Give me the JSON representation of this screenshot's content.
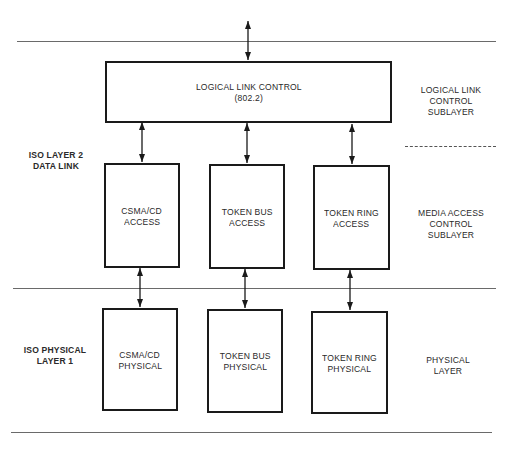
{
  "diagram": {
    "top_connector": {
      "label": ""
    },
    "llc": {
      "box_line1": "LOGICAL LINK CONTROL",
      "box_line2": "(802.2)",
      "side_line1": "LOGICAL LINK",
      "side_line2": "CONTROL SUBLAYER"
    },
    "layer2": {
      "label_line1": "ISO LAYER 2",
      "label_line2": "DATA LINK"
    },
    "mac": {
      "side_line1": "MEDIA ACCESS",
      "side_line2": "CONTROL SUBLAYER",
      "boxes": [
        {
          "line1": "CSMA/CD",
          "line2": "ACCESS"
        },
        {
          "line1": "TOKEN BUS",
          "line2": "ACCESS"
        },
        {
          "line1": "TOKEN RING",
          "line2": "ACCESS"
        }
      ]
    },
    "layer1": {
      "label_line1": "ISO PHYSICAL",
      "label_line2": "LAYER 1",
      "side_line1": "PHYSICAL",
      "side_line2": "LAYER",
      "boxes": [
        {
          "line1": "CSMA/CD",
          "line2": "PHYSICAL"
        },
        {
          "line1": "TOKEN BUS",
          "line2": "PHYSICAL"
        },
        {
          "line1": "TOKEN RING",
          "line2": "PHYSICAL"
        }
      ]
    }
  }
}
